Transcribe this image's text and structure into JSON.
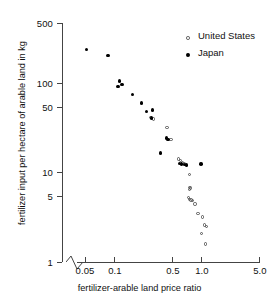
{
  "chart_data": {
    "type": "scatter",
    "title": "",
    "xlabel": "fertilizer-arable land price ratio",
    "ylabel": "fertilizer input per hectare of arable land in kg",
    "xscale": "log",
    "yscale": "log",
    "xlim": [
      0.035,
      5.0
    ],
    "ylim": [
      1,
      500
    ],
    "grid": false,
    "axis_break_x": true,
    "legend_position": "top-right",
    "xticks": [
      {
        "value": 0.05,
        "label": "0.05"
      },
      {
        "value": 0.1,
        "label": "0.1"
      },
      {
        "value": 0.5,
        "label": "0.5"
      },
      {
        "value": 1.0,
        "label": "1.0"
      },
      {
        "value": 5.0,
        "label": "5.0"
      }
    ],
    "yticks": [
      {
        "value": 500,
        "label": "500"
      },
      {
        "value": 100,
        "label": "100"
      },
      {
        "value": 50,
        "label": "50"
      },
      {
        "value": 10,
        "label": "10"
      },
      {
        "value": 5,
        "label": "5"
      },
      {
        "value": 1,
        "label": "1"
      }
    ],
    "series": [
      {
        "name": "United States",
        "marker": "open-circle",
        "color": "#555555",
        "points": [
          {
            "x": 0.285,
            "y": 43.0
          },
          {
            "x": 0.305,
            "y": 41.0
          },
          {
            "x": 0.44,
            "y": 33.0
          },
          {
            "x": 0.49,
            "y": 24.0
          },
          {
            "x": 0.6,
            "y": 14.5
          },
          {
            "x": 0.63,
            "y": 14.0
          },
          {
            "x": 0.66,
            "y": 13.3
          },
          {
            "x": 0.7,
            "y": 12.8
          },
          {
            "x": 0.8,
            "y": 9.7
          },
          {
            "x": 0.8,
            "y": 6.9
          },
          {
            "x": 0.82,
            "y": 6.8
          },
          {
            "x": 0.8,
            "y": 6.6
          },
          {
            "x": 0.78,
            "y": 5.3
          },
          {
            "x": 0.8,
            "y": 5.1
          },
          {
            "x": 0.83,
            "y": 5.0
          },
          {
            "x": 0.86,
            "y": 4.9
          },
          {
            "x": 0.92,
            "y": 4.5
          },
          {
            "x": 1.0,
            "y": 3.5
          },
          {
            "x": 1.12,
            "y": 3.2
          },
          {
            "x": 1.18,
            "y": 2.6
          },
          {
            "x": 1.25,
            "y": 2.5
          },
          {
            "x": 1.1,
            "y": 2.1
          },
          {
            "x": 1.22,
            "y": 1.6
          }
        ]
      },
      {
        "name": "Japan",
        "marker": "filled-circle",
        "color": "#000000",
        "points": [
          {
            "x": 0.052,
            "y": 250.0
          },
          {
            "x": 0.092,
            "y": 215.0
          },
          {
            "x": 0.125,
            "y": 110.0
          },
          {
            "x": 0.12,
            "y": 95.0
          },
          {
            "x": 0.133,
            "y": 100.0
          },
          {
            "x": 0.175,
            "y": 78.0
          },
          {
            "x": 0.225,
            "y": 62.0
          },
          {
            "x": 0.255,
            "y": 50.0
          },
          {
            "x": 0.3,
            "y": 52.0
          },
          {
            "x": 0.29,
            "y": 42.0
          },
          {
            "x": 0.435,
            "y": 25.0
          },
          {
            "x": 0.45,
            "y": 24.0
          },
          {
            "x": 0.37,
            "y": 17.0
          },
          {
            "x": 0.615,
            "y": 13.0
          },
          {
            "x": 0.645,
            "y": 12.8
          },
          {
            "x": 0.7,
            "y": 12.5
          },
          {
            "x": 0.74,
            "y": 12.4
          },
          {
            "x": 1.08,
            "y": 12.8
          }
        ]
      }
    ]
  }
}
